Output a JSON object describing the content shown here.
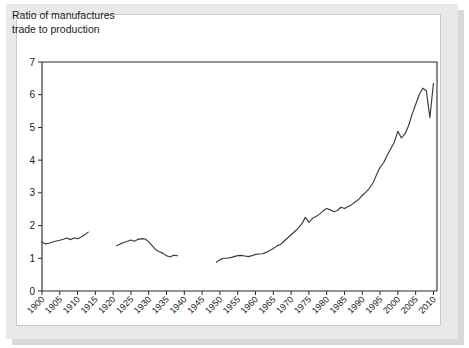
{
  "figure": {
    "background_color": "#ffffff",
    "mount_color": "#e9e9e9",
    "card_color": "#ffffff",
    "line_color": "#3a3a3a",
    "axis_color": "#2b2b2b"
  },
  "chart_data": {
    "type": "line",
    "title": "Ratio of manufactures\ntrade to production",
    "xlabel": "",
    "ylabel": "",
    "xlim": [
      1900,
      2011
    ],
    "ylim": [
      0,
      7
    ],
    "yticks": [
      0,
      1,
      2,
      3,
      4,
      5,
      6,
      7
    ],
    "ytick_labels": [
      "0",
      "1",
      "2",
      "3",
      "4",
      "5",
      "6",
      "7"
    ],
    "xticks": [
      1900,
      1905,
      1910,
      1915,
      1920,
      1925,
      1930,
      1935,
      1940,
      1945,
      1950,
      1955,
      1960,
      1965,
      1970,
      1975,
      1980,
      1985,
      1990,
      1995,
      2000,
      2005,
      2010
    ],
    "xtick_labels": [
      "1900",
      "1905",
      "1910",
      "1915",
      "1920",
      "1925",
      "1930",
      "1935",
      "1940",
      "1945",
      "1950",
      "1955",
      "1960",
      "1965",
      "1970",
      "1975",
      "1980",
      "1985",
      "1990",
      "1995",
      "2000",
      "2005",
      "2010"
    ],
    "grid": false,
    "legend": false,
    "legend_position": "none",
    "series": [
      {
        "name": "Ratio of manufactures trade to production",
        "segments": [
          {
            "label": "1900-1913",
            "x": [
              1900,
              1901,
              1902,
              1903,
              1904,
              1905,
              1906,
              1907,
              1908,
              1909,
              1910,
              1911,
              1912,
              1913
            ],
            "y": [
              1.5,
              1.44,
              1.46,
              1.5,
              1.53,
              1.55,
              1.58,
              1.62,
              1.57,
              1.62,
              1.6,
              1.65,
              1.72,
              1.8
            ]
          },
          {
            "label": "1921-1938",
            "x": [
              1921,
              1922,
              1923,
              1924,
              1925,
              1926,
              1927,
              1928,
              1929,
              1930,
              1931,
              1932,
              1933,
              1934,
              1935,
              1936,
              1937,
              1938
            ],
            "y": [
              1.38,
              1.44,
              1.48,
              1.52,
              1.56,
              1.52,
              1.58,
              1.6,
              1.59,
              1.5,
              1.38,
              1.26,
              1.2,
              1.15,
              1.08,
              1.04,
              1.09,
              1.08
            ]
          },
          {
            "label": "1949-2010",
            "x": [
              1949,
              1950,
              1951,
              1952,
              1953,
              1954,
              1955,
              1956,
              1957,
              1958,
              1959,
              1960,
              1961,
              1962,
              1963,
              1964,
              1965,
              1966,
              1967,
              1968,
              1969,
              1970,
              1971,
              1972,
              1973,
              1974,
              1975,
              1976,
              1977,
              1978,
              1979,
              1980,
              1981,
              1982,
              1983,
              1984,
              1985,
              1986,
              1987,
              1988,
              1989,
              1990,
              1991,
              1992,
              1993,
              1994,
              1995,
              1996,
              1997,
              1998,
              1999,
              2000,
              2001,
              2002,
              2003,
              2004,
              2005,
              2006,
              2007,
              2008,
              2009,
              2010
            ],
            "y": [
              0.88,
              0.96,
              1.0,
              1.0,
              1.02,
              1.05,
              1.08,
              1.09,
              1.07,
              1.05,
              1.08,
              1.12,
              1.13,
              1.14,
              1.18,
              1.24,
              1.3,
              1.38,
              1.42,
              1.52,
              1.62,
              1.72,
              1.82,
              1.92,
              2.05,
              2.25,
              2.1,
              2.22,
              2.28,
              2.35,
              2.45,
              2.52,
              2.48,
              2.42,
              2.46,
              2.56,
              2.52,
              2.58,
              2.64,
              2.72,
              2.8,
              2.92,
              3.02,
              3.14,
              3.3,
              3.55,
              3.78,
              3.92,
              4.15,
              4.35,
              4.55,
              4.88,
              4.68,
              4.8,
              5.05,
              5.4,
              5.7,
              6.0,
              6.2,
              6.12,
              5.3,
              6.35
            ]
          }
        ]
      }
    ],
    "annotations": [
      "Data gap between 1913 and 1921 (World War I)",
      "Data gap between 1938 and 1949 (World War II)"
    ]
  }
}
